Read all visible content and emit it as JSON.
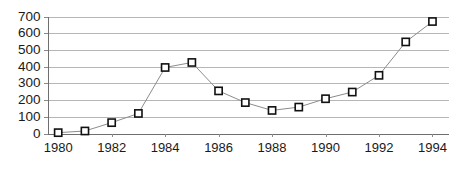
{
  "chart_data": {
    "type": "line",
    "title": "",
    "subtitle": "",
    "xlabel": "",
    "ylabel": "",
    "x": [
      1980,
      1981,
      1982,
      1983,
      1984,
      1985,
      1986,
      1987,
      1988,
      1989,
      1990,
      1991,
      1992,
      1993,
      1994
    ],
    "values": [
      5,
      15,
      65,
      120,
      395,
      425,
      255,
      185,
      138,
      158,
      208,
      248,
      348,
      548,
      670
    ],
    "series": [
      {
        "name": "series-1",
        "values": [
          5,
          15,
          65,
          120,
          395,
          425,
          255,
          185,
          138,
          158,
          208,
          248,
          348,
          548,
          670
        ]
      }
    ],
    "xlim": [
      1979.6,
      1994.6
    ],
    "ylim": [
      0,
      700
    ],
    "yticks": [
      0,
      100,
      200,
      300,
      400,
      500,
      600,
      700
    ],
    "ytick_labels": [
      "0",
      "100",
      "200",
      "300",
      "400",
      "500",
      "600",
      "700"
    ],
    "xticks": [
      1980,
      1982,
      1984,
      1986,
      1988,
      1990,
      1992,
      1994
    ],
    "xtick_labels": [
      "1980",
      "1982",
      "1984",
      "1986",
      "1988",
      "1990",
      "1992",
      "1994"
    ],
    "grid": "horizontal",
    "legend": "none",
    "marker": "open-square",
    "colors": {
      "line": "#8c8c8c",
      "marker_fill": "#ffffff",
      "marker_stroke": "#111111",
      "gridline": "#b6b6b6",
      "axis": "#6e6e6e",
      "text": "#1a1a1a",
      "background": "#ffffff"
    }
  }
}
